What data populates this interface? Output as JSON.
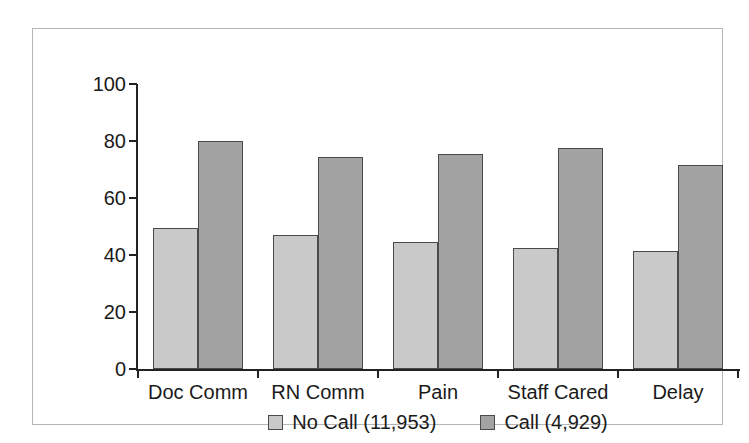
{
  "chart_data": {
    "type": "bar",
    "title": "",
    "subtitle": "",
    "xlabel": "",
    "ylabel": "",
    "ylim": [
      0,
      100
    ],
    "yticks": [
      0,
      20,
      40,
      60,
      80,
      100
    ],
    "grid": false,
    "legend_position": "bottom-center",
    "categories": [
      "Doc Comm",
      "RN Comm",
      "Pain",
      "Staff Cared",
      "Delay"
    ],
    "series": [
      {
        "name": "No Call (11,953)",
        "color": "#c9c9c9",
        "values": [
          49.5,
          47.0,
          44.5,
          42.5,
          41.5
        ]
      },
      {
        "name": "Call (4,929)",
        "color": "#a3a3a3",
        "values": [
          80.0,
          74.5,
          75.5,
          77.5,
          71.5
        ]
      }
    ]
  },
  "colors": {
    "series_light": "#c9c9c9",
    "series_dark": "#a3a3a3",
    "axis": "#232323",
    "frame": "#b6b6b6",
    "text": "#1a1a1a",
    "background": "#ffffff"
  }
}
